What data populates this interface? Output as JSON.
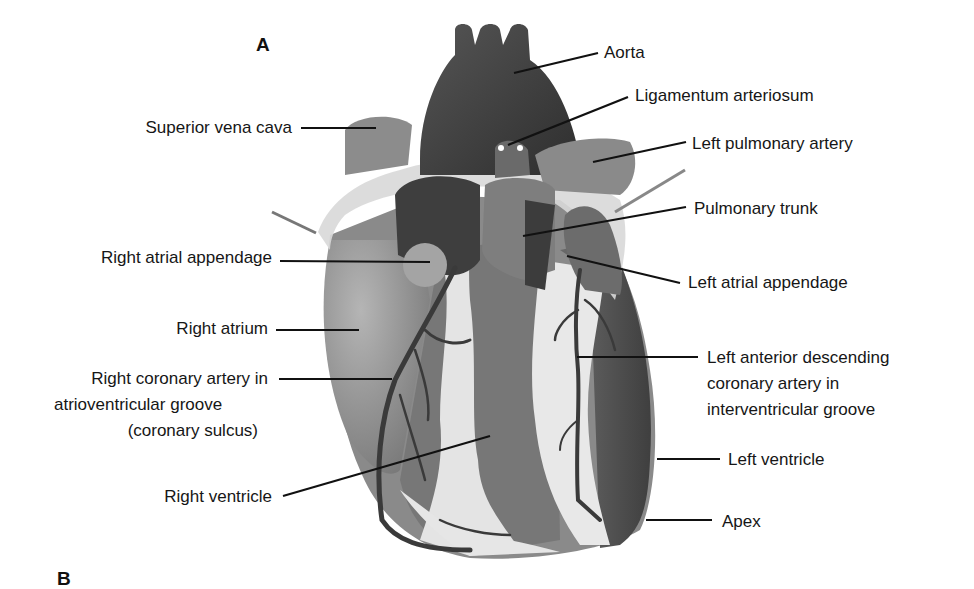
{
  "figure": {
    "panel_a": "A",
    "panel_b": "B",
    "colors": {
      "aorta": "#3a3a3a",
      "chamber_dark": "#474747",
      "chamber_mid": "#7a7a7a",
      "chamber_light": "#9a9a9a",
      "fat": "#e6e6e6",
      "pericardium": "#d0d0d0",
      "vessel": "#3b3b3b",
      "leader_line": "#111111"
    }
  },
  "labels_left": {
    "superior_vena_cava": "Superior vena cava",
    "right_atrial_appendage": "Right atrial appendage",
    "right_atrium": "Right atrium",
    "rca_line1": "Right coronary artery in",
    "rca_line2": "atrioventricular groove",
    "rca_line3": "(coronary sulcus)",
    "right_ventricle": "Right ventricle"
  },
  "labels_right": {
    "aorta": "Aorta",
    "ligamentum_arteriosum": "Ligamentum arteriosum",
    "left_pulmonary_artery": "Left pulmonary artery",
    "pulmonary_trunk": "Pulmonary trunk",
    "left_atrial_appendage": "Left atrial appendage",
    "lad_line1": "Left anterior descending",
    "lad_line2": "coronary artery in",
    "lad_line3": "interventricular groove",
    "left_ventricle": "Left ventricle",
    "apex": "Apex"
  }
}
